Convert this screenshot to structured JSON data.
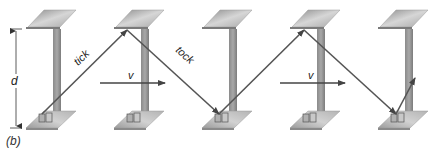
{
  "figure": {
    "panel_label": "(b)",
    "labels": {
      "distance": "d",
      "first_path": "tick",
      "second_path": "tock",
      "velocity": "v"
    },
    "clock_count": 5,
    "clocks": [
      {
        "id": 1,
        "cx": 45
      },
      {
        "id": 2,
        "cx": 133
      },
      {
        "id": 3,
        "cx": 221
      },
      {
        "id": 4,
        "cx": 309
      },
      {
        "id": 5,
        "cx": 397
      }
    ],
    "light_path_points": [
      [
        42,
        114
      ],
      [
        127,
        30
      ],
      [
        219,
        114
      ],
      [
        304,
        30
      ],
      [
        396,
        114
      ],
      [
        415,
        78
      ]
    ],
    "velocity_arrows": [
      {
        "x1": 100,
        "x2": 165,
        "y": 83
      },
      {
        "x1": 280,
        "x2": 345,
        "y": 83
      }
    ],
    "colors": {
      "mirror_light": "#d4d4d4",
      "mirror_dark": "#8a8a8a",
      "pillar": "#9a9a9a",
      "pillar_shadow": "#7c7c7c",
      "plate_light": "#cfcfcf",
      "plate_dark": "#9c9c9c",
      "light_ray": "#555555",
      "arrow": "#444444"
    }
  }
}
